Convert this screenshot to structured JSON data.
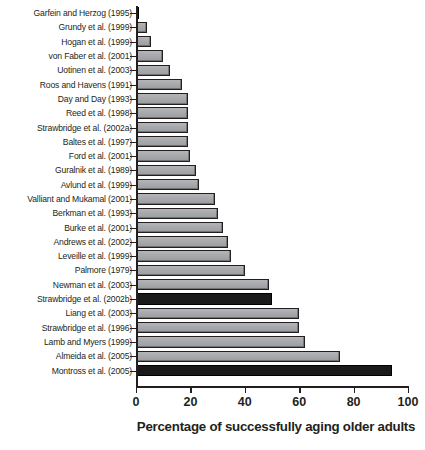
{
  "chart_data": {
    "type": "bar",
    "orientation": "horizontal",
    "title": "",
    "xlabel": "Percentage of successfully aging older adults",
    "ylabel": "",
    "xlim": [
      0,
      100
    ],
    "xticks": [
      0,
      20,
      40,
      60,
      80,
      100
    ],
    "xtick_labels": [
      "0",
      "20",
      "40",
      "60",
      "80",
      "100"
    ],
    "grid": false,
    "legend": "none",
    "colors": {
      "bar_light": "#a7a9ac",
      "bar_dark": "#1a1a1a",
      "outline": "#231f20",
      "text": "#231f20",
      "background": "#ffffff"
    },
    "categories": [
      "Garfein and Herzog (1995)",
      "Grundy et al. (1999)",
      "Hogan et al. (1999)",
      "von Faber et al. (2001)",
      "Uotinen et al. (2003)",
      "Roos and Havens (1991)",
      "Day and Day (1993)",
      "Reed et al. (1998)",
      "Strawbridge et al. (2002a)",
      "Baltes et al. (1997)",
      "Ford et al. (2001)",
      "Guralnik et al. (1989)",
      "Avlund et al. (1999)",
      "Valliant and Mukamal (2001)",
      "Berkman et al. (1993)",
      "Burke et al. (2001)",
      "Andrews et al. (2002)",
      "Leveille et al. (1999)",
      "Palmore (1979)",
      "Newman et al. (2003)",
      "Strawbridge et al. (2002b)",
      "Liang et al. (2003)",
      "Strawbridge et al. (1996)",
      "Lamb and Myers (1999)",
      "Almeida et al. (2005)",
      "Montross et al. (2005)"
    ],
    "values": [
      1,
      4,
      5.5,
      10,
      12.5,
      17,
      19,
      19,
      19,
      19,
      20,
      22,
      23,
      29,
      30,
      32,
      34,
      35,
      40,
      49,
      50,
      60,
      60,
      62,
      75,
      94
    ],
    "bars": [
      {
        "label": "Garfein and Herzog (1995)",
        "value": 1,
        "style": "dark"
      },
      {
        "label": "Grundy et al. (1999)",
        "value": 4,
        "style": "light"
      },
      {
        "label": "Hogan et al. (1999)",
        "value": 5.5,
        "style": "light"
      },
      {
        "label": "von Faber et al. (2001)",
        "value": 10,
        "style": "light"
      },
      {
        "label": "Uotinen et al. (2003)",
        "value": 12.5,
        "style": "light"
      },
      {
        "label": "Roos and Havens (1991)",
        "value": 17,
        "style": "light"
      },
      {
        "label": "Day and Day (1993)",
        "value": 19,
        "style": "light"
      },
      {
        "label": "Reed et al. (1998)",
        "value": 19,
        "style": "light"
      },
      {
        "label": "Strawbridge et al. (2002a)",
        "value": 19,
        "style": "light"
      },
      {
        "label": "Baltes et al. (1997)",
        "value": 19,
        "style": "light"
      },
      {
        "label": "Ford et al. (2001)",
        "value": 20,
        "style": "light"
      },
      {
        "label": "Guralnik et al. (1989)",
        "value": 22,
        "style": "light"
      },
      {
        "label": "Avlund et al. (1999)",
        "value": 23,
        "style": "light"
      },
      {
        "label": "Valliant and Mukamal (2001)",
        "value": 29,
        "style": "light"
      },
      {
        "label": "Berkman et al. (1993)",
        "value": 30,
        "style": "light"
      },
      {
        "label": "Burke et al. (2001)",
        "value": 32,
        "style": "light"
      },
      {
        "label": "Andrews et al. (2002)",
        "value": 34,
        "style": "light"
      },
      {
        "label": "Leveille et al. (1999)",
        "value": 35,
        "style": "light"
      },
      {
        "label": "Palmore (1979)",
        "value": 40,
        "style": "light"
      },
      {
        "label": "Newman et al. (2003)",
        "value": 49,
        "style": "light"
      },
      {
        "label": "Strawbridge et al. (2002b)",
        "value": 50,
        "style": "dark"
      },
      {
        "label": "Liang et al. (2003)",
        "value": 60,
        "style": "light"
      },
      {
        "label": "Strawbridge et al. (1996)",
        "value": 60,
        "style": "light"
      },
      {
        "label": "Lamb and Myers (1999)",
        "value": 62,
        "style": "light"
      },
      {
        "label": "Almeida et al. (2005)",
        "value": 75,
        "style": "light"
      },
      {
        "label": "Montross et al. (2005)",
        "value": 94,
        "style": "dark"
      }
    ]
  }
}
